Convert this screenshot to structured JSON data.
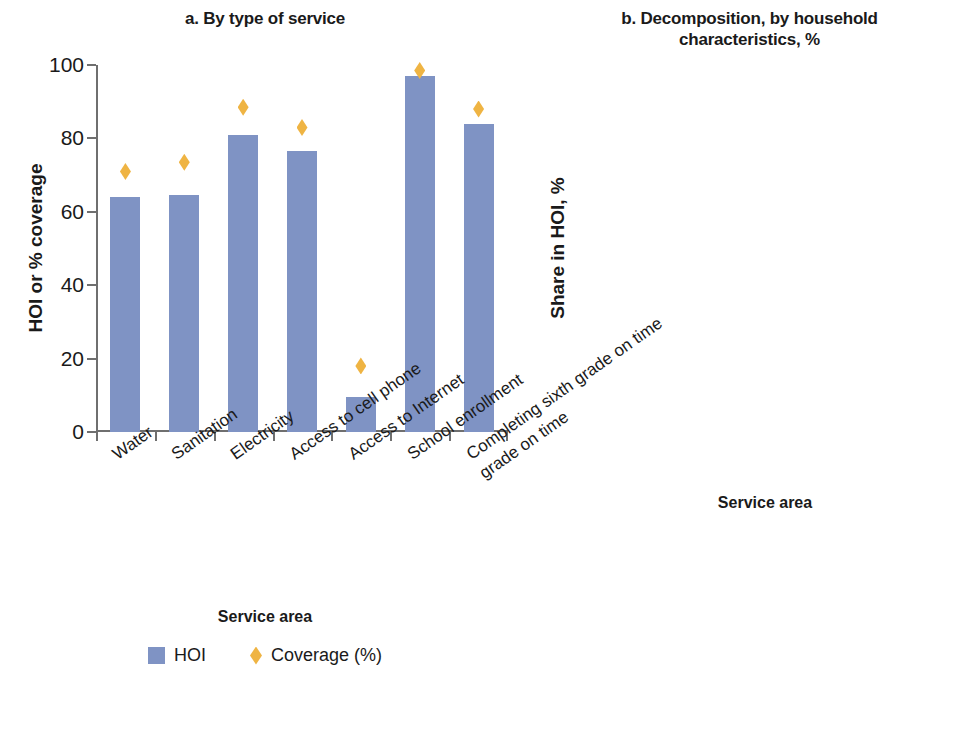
{
  "chart_data": [
    {
      "type": "bar",
      "panel": "a",
      "title": "a. By type of service",
      "xlabel": "Service area",
      "ylabel": "HOI or % coverage",
      "ylim": [
        0,
        100
      ],
      "yticks": [
        0,
        20,
        40,
        60,
        80,
        100
      ],
      "grid": false,
      "legend_position": "bottom",
      "categories": [
        "Water",
        "Sanitation",
        "Electricity",
        "Access to cell phone",
        "Access to Internet",
        "School enrollment",
        "Completing sixth grade on time"
      ],
      "series": [
        {
          "name": "HOI",
          "kind": "bar",
          "color": "#7f93c4",
          "values": [
            64,
            64.5,
            81,
            76.5,
            9.5,
            97,
            84
          ]
        },
        {
          "name": "Coverage (%)",
          "kind": "marker",
          "marker": "diamond",
          "color": "#efb443",
          "values": [
            71,
            73.5,
            88.5,
            83,
            18,
            98.5,
            88
          ]
        }
      ]
    },
    {
      "type": "bar",
      "panel": "b",
      "stacked": true,
      "title": "b. Decomposition, by household characteristics, %",
      "title_line_1": "b. Decomposition, by household",
      "title_line_2": "characteristics, %",
      "xlabel": "Service area",
      "ylabel": "Share in HOI, %",
      "ylim": [
        0,
        100
      ],
      "yticks": [
        0,
        20,
        40,
        60,
        80,
        100
      ],
      "grid": false,
      "legend_position": "below",
      "categories": [
        "Water",
        "Sanitation",
        "School enrollment"
      ],
      "category_lines": [
        [
          "Water"
        ],
        [
          "Sanitation"
        ],
        [
          "School",
          "enrollment"
        ]
      ],
      "series": [
        {
          "name": "Urban or rural",
          "color": "#f58c4a",
          "values": [
            43,
            43,
            23
          ],
          "labels": [
            "43",
            "43",
            "23"
          ]
        },
        {
          "name": "Per capita income",
          "color": "#9c5444",
          "values": [
            27,
            24,
            18
          ],
          "labels": [
            "27",
            "24",
            "18"
          ]
        },
        {
          "name": "Parental educational attainment",
          "color": "#aac98a",
          "values": [
            16,
            18,
            40
          ],
          "labels": [
            "16",
            "18",
            "40"
          ]
        },
        {
          "name": "Number of siblings",
          "color": "#f5e838",
          "values": [
            11,
            9,
            15
          ],
          "labels": [
            "11",
            "9",
            "15"
          ]
        },
        {
          "name": "Both parents in household",
          "color": "#4d8c33",
          "values": [
            2,
            3,
            1
          ],
          "labels": [
            "",
            "",
            ""
          ]
        },
        {
          "name": "Gender of the household head",
          "color": "#efb443",
          "values": [
            1,
            2,
            2
          ],
          "labels": [
            "",
            "",
            ""
          ]
        },
        {
          "name": "Gender",
          "color": "#7f93c4",
          "values": [
            0.5,
            1,
            3
          ],
          "labels": [
            "",
            "",
            ""
          ]
        }
      ],
      "legend_order": [
        "Gender",
        "Gender of the household head",
        "Both parents in household",
        "Number of siblings",
        "Parental educational attainment",
        "Per capita income",
        "Urban or rural"
      ]
    }
  ],
  "panel_a": {
    "title": "a. By type of service",
    "ylabel": "HOI or % coverage",
    "xlabel": "Service area",
    "yticks": [
      "100",
      "80",
      "60",
      "40",
      "20",
      "0"
    ],
    "categories": [
      "Water",
      "Sanitation",
      "Electricity",
      "Access to cell phone",
      "Access to Internet",
      "School enrollment",
      "Completing sixth"
    ],
    "category_extra": "grade on time",
    "legend": {
      "hoi": "HOI",
      "coverage": "Coverage (%)"
    }
  },
  "panel_b": {
    "title_line_1": "b. Decomposition, by household",
    "title_line_2": "characteristics, %",
    "ylabel": "Share in HOI, %",
    "xlabel": "Service area",
    "yticks": [
      "100",
      "80",
      "60",
      "40",
      "20",
      "0"
    ],
    "categories": [
      "Water",
      "Sanitation",
      "School"
    ],
    "category_3_line_2": "enrollment",
    "bar_labels": {
      "water": {
        "urban": "43",
        "income": "27",
        "parental": "16",
        "siblings": "11"
      },
      "sanitation": {
        "urban": "43",
        "income": "24",
        "parental": "18",
        "siblings": "9"
      },
      "school": {
        "urban": "23",
        "income": "18",
        "parental": "40",
        "siblings": "15"
      }
    },
    "legend": [
      "Gender",
      "Gender of the household head",
      "Both parents in household",
      "Number of siblings",
      "Parental educational attainment",
      "Per capita income",
      "Urban or rural"
    ]
  },
  "colors": {
    "hoi_bar": "#7f93c4",
    "coverage_marker": "#efb443",
    "urban_or_rural": "#f58c4a",
    "per_capita_income": "#9c5444",
    "parental_education": "#aac98a",
    "number_of_siblings": "#f5e838",
    "both_parents": "#4d8c33",
    "gender_household_head": "#efb443",
    "gender": "#7f93c4",
    "axis": "#6f6f6f",
    "text": "#1a1a1a"
  }
}
